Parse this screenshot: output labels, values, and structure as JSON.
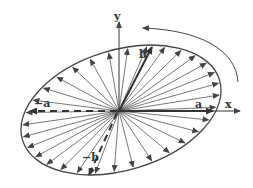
{
  "diagram": {
    "type": "rotating-ellipse-vectors",
    "labels": {
      "y_axis": "y",
      "x_axis": "x",
      "a": "a",
      "neg_a": "−a",
      "b": "b",
      "neg_b": "−b"
    },
    "colors": {
      "stroke": "#444444",
      "background": "#ffffff"
    },
    "rotation_arrow": "counter-clockwise"
  }
}
